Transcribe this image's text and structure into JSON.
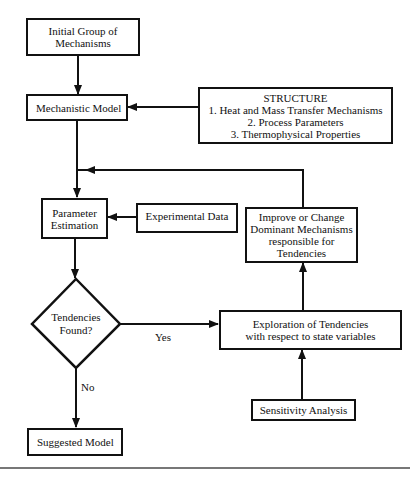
{
  "diagram": {
    "nodes": {
      "initial_group": {
        "line1": "Initial Group of",
        "line2": "Mechanisms"
      },
      "mechanistic_model": {
        "label": "Mechanistic Model"
      },
      "structure": {
        "title": "STRUCTURE",
        "items": [
          "1. Heat and Mass Transfer Mechanisms",
          "2. Process Parameters",
          "3. Thermophysical Properties"
        ]
      },
      "parameter_estimation": {
        "line1": "Parameter",
        "line2": "Estimation"
      },
      "experimental_data": {
        "label": "Experimental Data"
      },
      "improve": {
        "lines": [
          "Improve or Change",
          "Dominant Mechanisms",
          "responsible for",
          "Tendencies"
        ]
      },
      "decision": {
        "line1": "Tendencies",
        "line2": "Found?"
      },
      "exploration": {
        "line1": "Exploration of Tendencies",
        "line2": "with respect to state variables"
      },
      "sensitivity": {
        "label": "Sensitivity Analysis"
      },
      "suggested_model": {
        "label": "Suggested Model"
      }
    },
    "edge_labels": {
      "yes": "Yes",
      "no": "No"
    }
  }
}
